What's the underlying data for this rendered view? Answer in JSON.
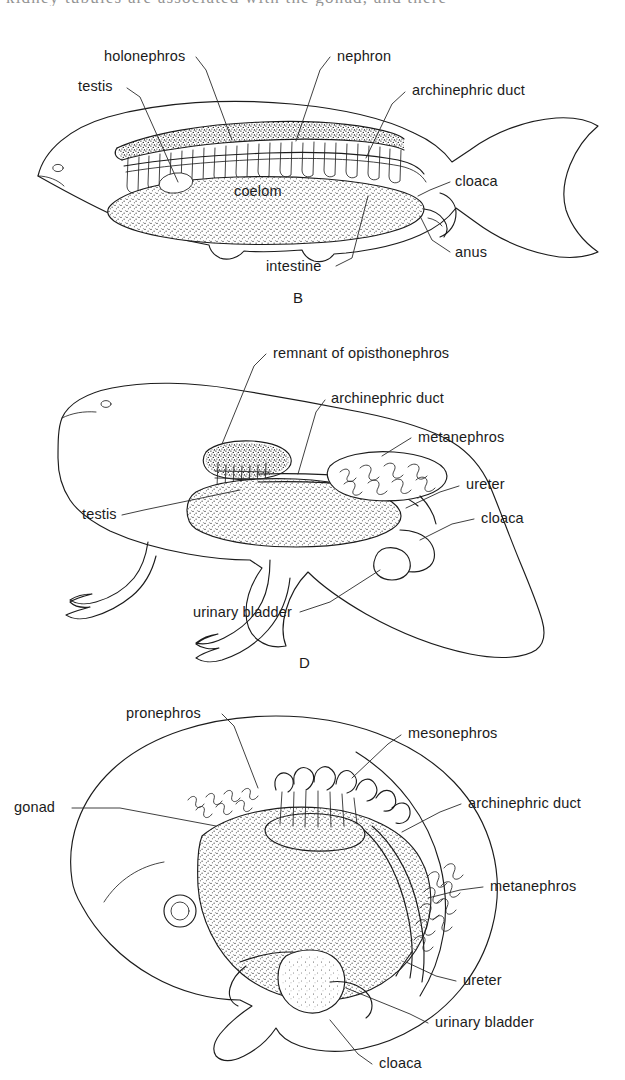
{
  "page": {
    "width": 625,
    "height": 1080,
    "background_color": "#ffffff",
    "ink_color": "#1b1b1b",
    "kind": "textbook anatomical line drawing",
    "cutoff_running_text": "kidney tubules are associated with the gonad, and there"
  },
  "panels": [
    {
      "id": "B",
      "letter": "B",
      "caption_letter_pos": {
        "x": 293,
        "y": 303
      },
      "organism": "fish",
      "labels": [
        {
          "key": "holonephros",
          "text": "holonephros",
          "x": 104,
          "y": 61,
          "anchor": "start"
        },
        {
          "key": "nephron",
          "text": "nephron",
          "x": 337,
          "y": 61,
          "anchor": "start"
        },
        {
          "key": "testis",
          "text": "testis",
          "x": 78,
          "y": 91,
          "anchor": "start"
        },
        {
          "key": "archinephric_duct",
          "text": "archinephric duct",
          "x": 412,
          "y": 95,
          "anchor": "start"
        },
        {
          "key": "coelom",
          "text": "coelom",
          "x": 234,
          "y": 196,
          "anchor": "start"
        },
        {
          "key": "cloaca",
          "text": "cloaca",
          "x": 455,
          "y": 186,
          "anchor": "start"
        },
        {
          "key": "anus",
          "text": "anus",
          "x": 455,
          "y": 257,
          "anchor": "start"
        },
        {
          "key": "intestine",
          "text": "intestine",
          "x": 266,
          "y": 271,
          "anchor": "start"
        }
      ]
    },
    {
      "id": "D",
      "letter": "D",
      "caption_letter_pos": {
        "x": 299,
        "y": 668
      },
      "organism": "salamander",
      "labels": [
        {
          "key": "remnant_of_opisthonephros",
          "text": "remnant of opisthonephros",
          "x": 273,
          "y": 358,
          "anchor": "start"
        },
        {
          "key": "archinephric_duct",
          "text": "archinephric duct",
          "x": 331,
          "y": 403,
          "anchor": "start"
        },
        {
          "key": "metanephros",
          "text": "metanephros",
          "x": 418,
          "y": 442,
          "anchor": "start"
        },
        {
          "key": "ureter",
          "text": "ureter",
          "x": 466,
          "y": 489,
          "anchor": "start"
        },
        {
          "key": "cloaca",
          "text": "cloaca",
          "x": 481,
          "y": 523,
          "anchor": "start"
        },
        {
          "key": "testis",
          "text": "testis",
          "x": 82,
          "y": 519,
          "anchor": "start"
        },
        {
          "key": "urinary_bladder",
          "text": "urinary bladder",
          "x": 193,
          "y": 617,
          "anchor": "start"
        }
      ]
    },
    {
      "id": "embryo",
      "letter": "",
      "organism": "amniote embryo",
      "labels": [
        {
          "key": "pronephros",
          "text": "pronephros",
          "x": 126,
          "y": 718,
          "anchor": "start"
        },
        {
          "key": "mesonephros",
          "text": "mesonephros",
          "x": 408,
          "y": 738,
          "anchor": "start"
        },
        {
          "key": "gonad",
          "text": "gonad",
          "x": 14,
          "y": 812,
          "anchor": "start"
        },
        {
          "key": "archinephric_duct",
          "text": "archinephric duct",
          "x": 468,
          "y": 808,
          "anchor": "start"
        },
        {
          "key": "metanephros",
          "text": "metanephros",
          "x": 490,
          "y": 891,
          "anchor": "start"
        },
        {
          "key": "ureter",
          "text": "ureter",
          "x": 463,
          "y": 985,
          "anchor": "start"
        },
        {
          "key": "urinary_bladder",
          "text": "urinary bladder",
          "x": 435,
          "y": 1027,
          "anchor": "start"
        },
        {
          "key": "cloaca",
          "text": "cloaca",
          "x": 379,
          "y": 1068,
          "anchor": "start"
        }
      ]
    }
  ]
}
